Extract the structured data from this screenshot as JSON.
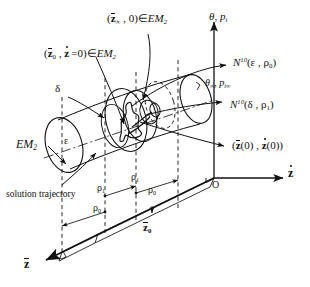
{
  "figure": {
    "background": "#ffffff",
    "stroke": "#111111",
    "width": 310,
    "height": 287
  },
  "labels": {
    "top_center": {
      "text": "(z̄∞ , 0) ∈ EM2",
      "parts": {
        "var": "z",
        "sub": "∞",
        "zero": "0",
        "member": "∈",
        "set": "EM",
        "set_sub": "2"
      }
    },
    "upper_left": {
      "text": "(z̄0 , ż = 0) ∈ EM2",
      "parts": {
        "var": "z",
        "sub": "0",
        "dotvar": "z",
        "eq": "=0",
        "member": "∈",
        "set": "EM",
        "set_sub": "2"
      }
    },
    "theta_pi": {
      "text": "θ , pi",
      "theta": "θ",
      "comma": ",",
      "p": "p",
      "p_sub": "i"
    },
    "theta_inf": {
      "text": "θ∞ , pi∞",
      "theta": "θ",
      "theta_sub": "∞",
      "p": "p",
      "p_sub": "i∞"
    },
    "n10_eps": {
      "text": "N10(ε , ρ0)",
      "N": "N",
      "sup": "10",
      "arg1": "ε",
      "arg2_base": "ρ",
      "arg2_sub": "0"
    },
    "n10_delta": {
      "text": "N10(δ , ρ1)",
      "N": "N",
      "sup": "10",
      "arg1": "δ",
      "arg2_base": "ρ",
      "arg2_sub": "1"
    },
    "initial_state": {
      "text": "(z̄(0) , ż(0))",
      "var": "z",
      "arg": "(0)"
    },
    "em2_left": {
      "text": "EM2",
      "set": "EM",
      "set_sub": "2"
    },
    "delta": {
      "text": "δ"
    },
    "epsilon": {
      "text": "ε"
    },
    "solution_trajectory": {
      "text": "solution trajectory"
    },
    "rho_1_upper": {
      "text": "ρ1",
      "base": "ρ",
      "sub": "1"
    },
    "rho_1_lower": {
      "text": "ρ1",
      "base": "ρ",
      "sub": "1"
    },
    "rho_0_upper": {
      "text": "ρ0",
      "base": "ρ",
      "sub": "0"
    },
    "rho_0_lower": {
      "text": "ρ0",
      "base": "ρ",
      "sub": "0"
    },
    "origin": {
      "text": "O"
    },
    "axis_zdot": {
      "text": "ż",
      "base": "z"
    },
    "axis_zbar": {
      "text": "z̄",
      "base": "z"
    },
    "zbar_0": {
      "text": "z̄0",
      "base": "z",
      "sub": "0"
    }
  }
}
